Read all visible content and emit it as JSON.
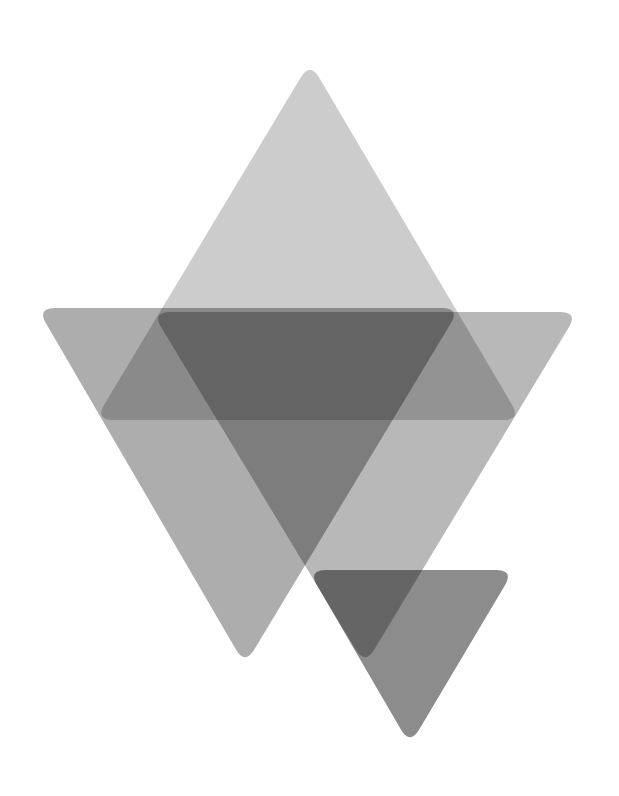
{
  "canvas": {
    "width": 619,
    "height": 796,
    "background": "#ffffff"
  },
  "shapes": [
    {
      "name": "upright-triangle",
      "points": [
        [
          310,
          62
        ],
        [
          95,
          420
        ],
        [
          521,
          420
        ]
      ],
      "color": "#cccccc"
    },
    {
      "name": "left-inverted-triangle",
      "points": [
        [
          37,
          308
        ],
        [
          460,
          308
        ],
        [
          245,
          665
        ]
      ],
      "color": "#adadad"
    },
    {
      "name": "right-inverted-triangle",
      "points": [
        [
          152,
          312
        ],
        [
          578,
          312
        ],
        [
          365,
          665
        ]
      ],
      "color": "#b8b8b8"
    },
    {
      "name": "small-inverted-triangle",
      "points": [
        [
          308,
          570
        ],
        [
          514,
          570
        ],
        [
          410,
          745
        ]
      ],
      "color": "#8c8c8c"
    }
  ]
}
